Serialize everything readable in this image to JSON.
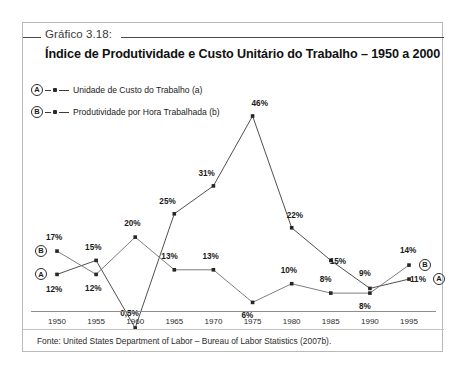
{
  "figure": {
    "number_label": "Gráfico 3.18:",
    "title": "Índice de Produtividade e Custo Unitário do Trabalho – 1950 a 2000",
    "source": "Fonte: United States Department of Labor – Bureau of Labor Statistics (2007b)."
  },
  "legend": {
    "items": [
      {
        "key": "A",
        "label": "Unidade de Custo do Trabalho (a)"
      },
      {
        "key": "B",
        "label": "Produtividade por Hora Trabalhada (b)"
      }
    ]
  },
  "markers": {
    "start_a": "A",
    "start_b": "B",
    "end_a": "A",
    "end_b": "B"
  },
  "chart_data": {
    "type": "line",
    "title": "Índice de Produtividade e Custo Unitário do Trabalho – 1950 a 2000",
    "xlabel": "",
    "ylabel": "",
    "grid": false,
    "legend_position": "top-left",
    "categories": [
      "1950",
      "1955",
      "1960",
      "1965",
      "1970",
      "1975",
      "1980",
      "1985",
      "1990",
      "1995"
    ],
    "ylim": [
      0,
      50
    ],
    "series": [
      {
        "name": "Unidade de Custo do Trabalho (a)",
        "key": "A",
        "color": "#3c3c3c",
        "values": [
          12,
          15,
          0.5,
          25,
          31,
          46,
          22,
          15,
          9,
          11
        ],
        "labels": [
          "12%",
          "15%",
          "0,5%",
          "25%",
          "31%",
          "46%",
          "22%",
          "15%",
          "9%",
          "11%"
        ]
      },
      {
        "name": "Produtividade por Hora Trabalhada (b)",
        "key": "B",
        "color": "#6e6e6e",
        "values": [
          17,
          12,
          20,
          13,
          13,
          6,
          10,
          8,
          8,
          14
        ],
        "labels": [
          "17%",
          "12%",
          "20%",
          "13%",
          "13%",
          "6%",
          "10%",
          "8%",
          "8%",
          "14%"
        ]
      }
    ]
  },
  "axis": {
    "ticks": [
      "1950",
      "1955",
      "1960",
      "1965",
      "1970",
      "1975",
      "1980",
      "1985",
      "1990",
      "1995"
    ]
  }
}
